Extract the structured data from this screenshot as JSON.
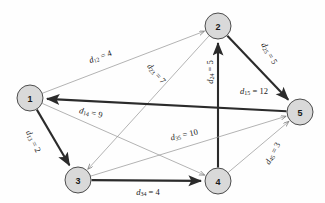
{
  "figure": {
    "type": "directed-weighted-graph",
    "background_color": "#fefefe",
    "node_fill": "#d9d9d9",
    "node_stroke": "#4d4d4d",
    "thick_edge_color": "#2b2b2b",
    "thin_edge_color": "#9a9a9a"
  },
  "nodes": [
    {
      "id": "1",
      "label": "1",
      "x": 30,
      "y": 98
    },
    {
      "id": "2",
      "label": "2",
      "x": 218,
      "y": 26
    },
    {
      "id": "3",
      "label": "3",
      "x": 78,
      "y": 180
    },
    {
      "id": "4",
      "label": "4",
      "x": 218,
      "y": 181
    },
    {
      "id": "5",
      "label": "5",
      "x": 300,
      "y": 112
    }
  ],
  "edges": [
    {
      "id": "e12",
      "from": "1",
      "to": "2",
      "symbol": "d",
      "sub": "12",
      "value": "4",
      "label": "d12 = 4",
      "weight": 4,
      "style": "thin",
      "label_x": 100,
      "label_y": 56,
      "label_rot": -20
    },
    {
      "id": "e23",
      "from": "2",
      "to": "3",
      "symbol": "d",
      "sub": "23",
      "value": "7",
      "label": "d23 = 7",
      "weight": 7,
      "style": "thin",
      "label_x": 157,
      "label_y": 73,
      "label_rot": 49
    },
    {
      "id": "e24",
      "from": "4",
      "to": "2",
      "symbol": "d",
      "sub": "24",
      "value": "5",
      "label": "d24 = 5",
      "weight": 5,
      "style": "thick",
      "label_x": 209,
      "label_y": 72,
      "label_rot": -90
    },
    {
      "id": "e25",
      "from": "2",
      "to": "5",
      "symbol": "d",
      "sub": "25",
      "value": "5",
      "label": "d25 = 5",
      "weight": 5,
      "style": "thick",
      "label_x": 270,
      "label_y": 53,
      "label_rot": 60
    },
    {
      "id": "e15",
      "from": "5",
      "to": "1",
      "symbol": "d",
      "sub": "15",
      "value": "12",
      "label": "d15 = 12",
      "weight": 12,
      "style": "thick",
      "label_x": 254,
      "label_y": 90,
      "label_rot": 0
    },
    {
      "id": "e14",
      "from": "1",
      "to": "4",
      "symbol": "d",
      "sub": "14",
      "value": "9",
      "label": "d14 = 9",
      "weight": 9,
      "style": "thin",
      "label_x": 91,
      "label_y": 112,
      "label_rot": 12
    },
    {
      "id": "e13",
      "from": "1",
      "to": "3",
      "symbol": "d",
      "sub": "13",
      "value": "2",
      "label": "d13 = 2",
      "weight": 2,
      "style": "thick",
      "label_x": 34,
      "label_y": 141,
      "label_rot": 64
    },
    {
      "id": "e35",
      "from": "3",
      "to": "5",
      "symbol": "d",
      "sub": "35",
      "value": "10",
      "label": "d35 = 10",
      "weight": 10,
      "style": "thin",
      "label_x": 184,
      "label_y": 134,
      "label_rot": -13
    },
    {
      "id": "e34",
      "from": "3",
      "to": "4",
      "symbol": "d",
      "sub": "34",
      "value": "4",
      "label": "d34 = 4",
      "weight": 4,
      "style": "thick",
      "label_x": 148,
      "label_y": 191,
      "label_rot": 0
    },
    {
      "id": "e45",
      "from": "4",
      "to": "5",
      "symbol": "d",
      "sub": "45",
      "value": "3",
      "label": "d45 = 3",
      "weight": 3,
      "style": "thin",
      "label_x": 272,
      "label_y": 153,
      "label_rot": -62
    }
  ]
}
